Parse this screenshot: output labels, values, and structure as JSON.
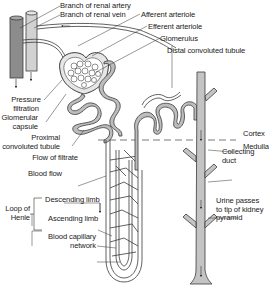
{
  "diagram": {
    "colors": {
      "background": "#ffffff",
      "line": "#3a3a3a",
      "tubule_fill": "#bdbdbd",
      "artery_fill": "#8c8c8c",
      "vein_fill": "#d2d2d2",
      "duct_fill": "#c4c4c4",
      "text": "#222222"
    },
    "labels": {
      "renal_artery": "Branch of renal artery",
      "renal_vein": "Branch of renal vein",
      "afferent_arteriole": "Afferent arteriole",
      "efferent_arteriole": "Efferent arteriole",
      "glomerulus": "Glomerulus",
      "distal_tubule": "Distal convoluted tubule",
      "pressure_filtration_line1": "Pressure",
      "pressure_filtration_line2": "filtration",
      "glomerular_capsule_line1": "Glomerular",
      "glomerular_capsule_line2": "capsule",
      "proximal_tubule_line1": "Proximal",
      "proximal_tubule_line2": "convoluted tubule",
      "cortex": "Cortex",
      "medulla": "Medulla",
      "flow_of_filtrate": "Flow of filtrate",
      "blood_flow": "Blood flow",
      "collecting_duct_line1": "Collecting",
      "collecting_duct_line2": "duct",
      "loop_of_henle_line1": "Loop of",
      "loop_of_henle_line2": "Henle",
      "descending_limb": "Descending limb",
      "ascending_limb": "Ascending limb",
      "capillary_line1": "Blood capillary",
      "capillary_line2": "network",
      "urine_line1": "Urine passes",
      "urine_line2": "to tip of kidney",
      "urine_line3": "pyramid"
    }
  }
}
